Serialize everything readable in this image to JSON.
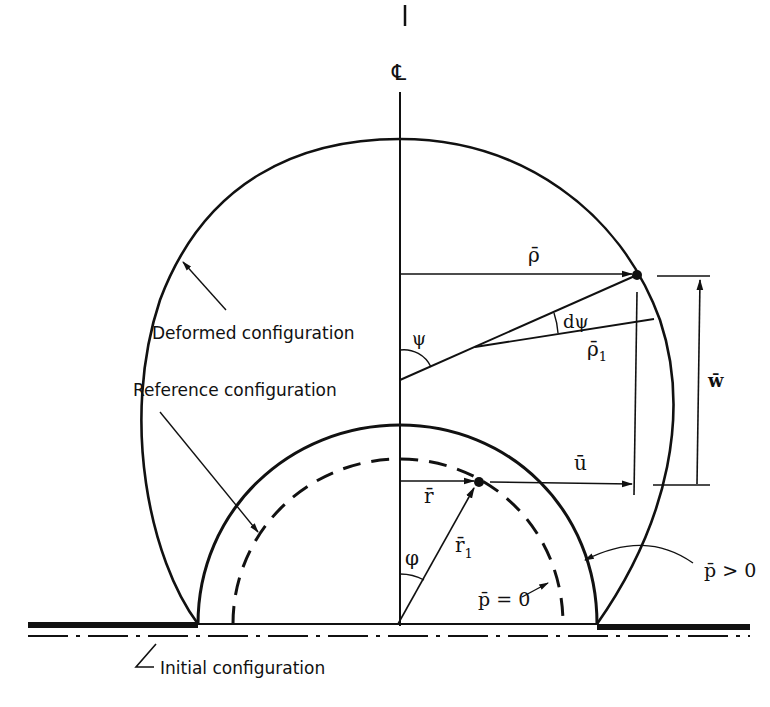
{
  "figure": {
    "centerline_label": "℄",
    "labels": {
      "deformed": "Deformed configuration",
      "reference": "Reference configuration",
      "initial": "Initial configuration",
      "p_zero": "p̄ = 0",
      "p_positive": "p̄ > 0"
    },
    "symbols": {
      "rho": "ρ̄",
      "rho1": "ρ̄",
      "rho1_sub": "1",
      "psi": "ψ",
      "dpsi": "dψ",
      "w": "w̄",
      "u": "ū",
      "r": "r̄",
      "r1": "r̄",
      "r1_sub": "1",
      "phi": "φ"
    },
    "colors": {
      "ink": "#111111",
      "background": "#ffffff"
    }
  }
}
